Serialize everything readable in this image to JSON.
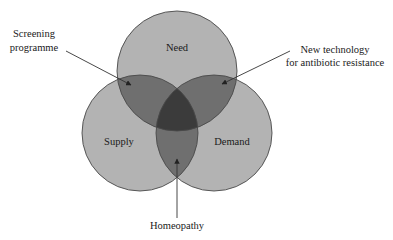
{
  "diagram": {
    "type": "venn",
    "colors": {
      "single": "#b3b3b3",
      "pair": "#6f6f6f",
      "triple": "#3b3b3b",
      "outline": "#4a4a4a",
      "arrow": "#333333",
      "text": "#1a1a1a"
    },
    "circles": [
      {
        "id": "need",
        "label": "Need"
      },
      {
        "id": "supply",
        "label": "Supply"
      },
      {
        "id": "demand",
        "label": "Demand"
      }
    ],
    "annotations": [
      {
        "id": "screening",
        "lines": [
          "Screening",
          "programme"
        ],
        "points_to": "Need ∩ Supply"
      },
      {
        "id": "new-tech",
        "lines": [
          "New technology",
          "for antibiotic resistance"
        ],
        "points_to": "Need ∩ Demand"
      },
      {
        "id": "homeopathy",
        "lines": [
          "Homeopathy"
        ],
        "points_to": "Supply ∩ Demand"
      }
    ]
  }
}
